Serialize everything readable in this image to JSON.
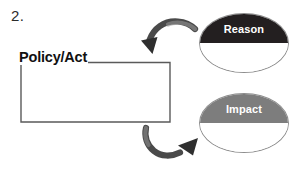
{
  "worksheet": {
    "item_number": "2.",
    "background_color": "#ffffff"
  },
  "diagram": {
    "source_node": {
      "label": "Policy/Act",
      "text_color": "#111111"
    },
    "answer_box": {
      "name": "policy-act-answer-box",
      "value": "",
      "border_color": "#5a5a5a"
    },
    "branches": [
      {
        "label": "Reason",
        "cap_color": "#231f20",
        "label_color": "#ffffff",
        "outline_color": "#8e8e8e",
        "arrow_name": "curved-arrow-to-reason"
      },
      {
        "label": "Impact",
        "cap_color": "#7d7d7d",
        "label_color": "#ffffff",
        "outline_color": "#8e8e8e",
        "arrow_name": "curved-arrow-to-impact"
      }
    ],
    "connector_color": "#5a5a5a",
    "arrow_color": "#3c3c3c"
  }
}
